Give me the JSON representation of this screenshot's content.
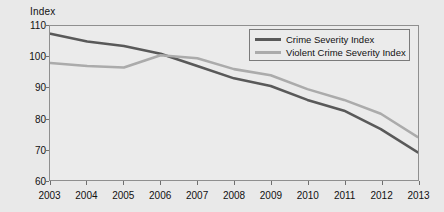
{
  "chart_data": {
    "type": "line",
    "title": "",
    "subtitle": "",
    "xlabel": "",
    "ylabel": "Index",
    "ylim": [
      60,
      110
    ],
    "yticks": [
      60,
      70,
      80,
      90,
      100,
      110
    ],
    "grid": false,
    "legend_position": "top-right",
    "x": [
      2003,
      2004,
      2005,
      2006,
      2007,
      2008,
      2009,
      2010,
      2011,
      2012,
      2013
    ],
    "categories": [
      "2003",
      "2004",
      "2005",
      "2006",
      "2007",
      "2008",
      "2009",
      "2010",
      "2011",
      "2012",
      "2013"
    ],
    "series": [
      {
        "name": "Crime Severity Index",
        "color": "#595959",
        "values": [
          107.5,
          105.0,
          103.5,
          101.0,
          97.0,
          93.0,
          90.5,
          86.0,
          82.5,
          76.5,
          69.0
        ]
      },
      {
        "name": "Violent Crime Severity Index",
        "color": "#ababab",
        "values": [
          98.0,
          97.0,
          96.5,
          100.5,
          99.5,
          96.0,
          94.0,
          89.5,
          86.0,
          81.5,
          74.0
        ]
      }
    ]
  },
  "legend": {
    "entries": [
      {
        "label": "Crime Severity Index",
        "color": "#595959"
      },
      {
        "label": "Violent Crime Severity Index",
        "color": "#ababab"
      }
    ]
  },
  "colors": {
    "page_background": "#e9e9e9",
    "plot_background": "#ebebeb",
    "axis": "#8f8f8f",
    "text": "#111111"
  }
}
